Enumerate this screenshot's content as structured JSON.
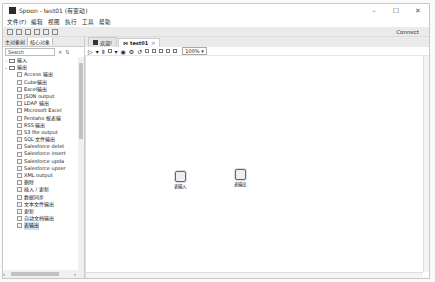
{
  "window": {
    "title": "Spoon - test01 (有变动)",
    "controls": [
      "minimize",
      "maximize",
      "close"
    ]
  },
  "menu": [
    "文件(F)",
    "编辑",
    "视图",
    "执行",
    "工具",
    "帮助"
  ],
  "toolbar": {
    "connect_label": "Connect"
  },
  "left_panel": {
    "tabs": [
      {
        "label": "主对象树",
        "active": false
      },
      {
        "label": "核心对象",
        "active": true
      }
    ],
    "search": {
      "placeholder": "Search",
      "value": "Search"
    },
    "tree": [
      {
        "label": "输入",
        "type": "folder",
        "expanded": false
      },
      {
        "label": "输出",
        "type": "folder",
        "expanded": true
      },
      {
        "label": "Access 输出",
        "type": "leaf"
      },
      {
        "label": "Cube输出",
        "type": "leaf"
      },
      {
        "label": "Excel输出",
        "type": "leaf"
      },
      {
        "label": "JSON output",
        "type": "leaf"
      },
      {
        "label": "LDAP 输出",
        "type": "leaf"
      },
      {
        "label": "Microsoft Excel",
        "type": "leaf"
      },
      {
        "label": "Pentaho 报表输",
        "type": "leaf"
      },
      {
        "label": "RSS 输出",
        "type": "leaf"
      },
      {
        "label": "S3 file output",
        "type": "leaf"
      },
      {
        "label": "SQL 文件输出",
        "type": "leaf"
      },
      {
        "label": "Salesforce delet",
        "type": "leaf"
      },
      {
        "label": "Salesforce insert",
        "type": "leaf"
      },
      {
        "label": "Salesforce upda",
        "type": "leaf"
      },
      {
        "label": "Salesforce upser",
        "type": "leaf"
      },
      {
        "label": "XML output",
        "type": "leaf"
      },
      {
        "label": "删除",
        "type": "leaf"
      },
      {
        "label": "插入 / 更新",
        "type": "leaf"
      },
      {
        "label": "数据同步",
        "type": "leaf"
      },
      {
        "label": "文本文件输出",
        "type": "leaf"
      },
      {
        "label": "更新",
        "type": "leaf"
      },
      {
        "label": "自动文档输出",
        "type": "leaf"
      },
      {
        "label": "表输出",
        "type": "leaf",
        "selected": true
      }
    ]
  },
  "editor": {
    "tabs": [
      {
        "label": "欢迎!",
        "active": false
      },
      {
        "label": "test01",
        "active": true
      }
    ],
    "zoom": "100%",
    "steps": [
      {
        "label": "表输入",
        "x": 92,
        "y": 135
      },
      {
        "label": "表输出",
        "x": 152,
        "y": 133
      }
    ]
  }
}
